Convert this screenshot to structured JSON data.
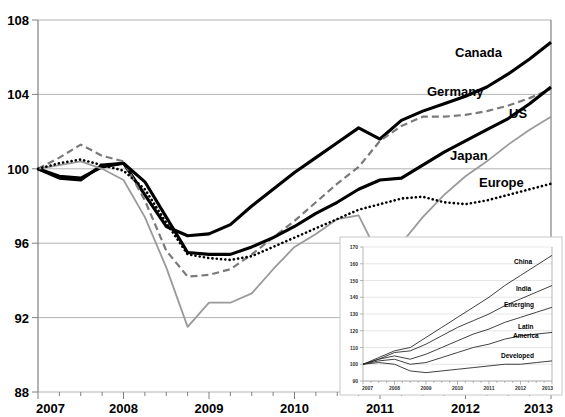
{
  "chart_data": [
    {
      "id": "main",
      "type": "line",
      "title": "",
      "subtitle": "",
      "xlabel": "",
      "ylabel": "",
      "xlim": [
        2007,
        2013
      ],
      "ylim": [
        88,
        108
      ],
      "yticks": [
        88,
        92,
        96,
        100,
        104,
        108
      ],
      "xticks": [
        2007,
        2008,
        2009,
        2010,
        2011,
        2012,
        2013
      ],
      "xtick_labels": [
        "2007",
        "2008",
        "2009",
        "2010",
        "2011",
        "2012",
        "2013"
      ],
      "ytick_labels": [
        "88",
        "92",
        "96",
        "100",
        "104",
        "108"
      ],
      "grid": true,
      "legend_position": "inline-right",
      "x": [
        2007.0,
        2007.25,
        2007.5,
        2007.75,
        2008.0,
        2008.25,
        2008.5,
        2008.75,
        2009.0,
        2009.25,
        2009.5,
        2009.75,
        2010.0,
        2010.25,
        2010.5,
        2010.75,
        2011.0,
        2011.25,
        2011.5,
        2011.75,
        2012.0,
        2012.25,
        2012.5,
        2012.75,
        2013.0
      ],
      "series": [
        {
          "name": "Canada",
          "style": "solid-thick-black",
          "color": "#000000",
          "values": [
            100.0,
            99.5,
            99.4,
            100.2,
            100.3,
            98.6,
            96.9,
            96.4,
            96.5,
            97.0,
            98.0,
            98.9,
            99.8,
            100.6,
            101.4,
            102.2,
            101.6,
            102.6,
            103.1,
            103.5,
            103.9,
            104.4,
            105.1,
            105.9,
            106.8
          ]
        },
        {
          "name": "Germany",
          "style": "dashed-gray",
          "color": "#7a7a7a",
          "values": [
            100.0,
            100.6,
            101.3,
            100.7,
            100.4,
            98.3,
            95.6,
            94.2,
            94.3,
            94.6,
            95.4,
            96.3,
            97.2,
            98.2,
            99.2,
            100.1,
            101.5,
            102.3,
            102.8,
            102.8,
            102.9,
            103.1,
            103.4,
            103.8,
            104.3
          ]
        },
        {
          "name": "US",
          "style": "solid-thick-black",
          "color": "#000000",
          "values": [
            100.0,
            99.6,
            99.5,
            100.1,
            100.3,
            99.3,
            97.4,
            95.5,
            95.4,
            95.4,
            95.8,
            96.3,
            96.9,
            97.6,
            98.2,
            98.9,
            99.4,
            99.5,
            100.2,
            100.9,
            101.5,
            102.1,
            102.7,
            103.5,
            104.4
          ]
        },
        {
          "name": "Japan",
          "style": "solid-thin-gray",
          "color": "#9a9a9a",
          "values": [
            100.0,
            100.2,
            100.4,
            100.0,
            99.4,
            97.4,
            94.7,
            91.5,
            92.8,
            92.8,
            93.3,
            94.6,
            95.8,
            96.5,
            97.3,
            97.5,
            95.2,
            96.0,
            97.4,
            98.6,
            99.6,
            100.4,
            101.3,
            102.1,
            102.8
          ]
        },
        {
          "name": "Europe",
          "style": "dotted-black",
          "color": "#000000",
          "values": [
            100.0,
            100.3,
            100.5,
            100.2,
            99.9,
            98.9,
            97.1,
            95.4,
            95.2,
            95.1,
            95.3,
            95.8,
            96.3,
            96.8,
            97.3,
            97.8,
            98.1,
            98.4,
            98.5,
            98.2,
            98.1,
            98.3,
            98.6,
            98.9,
            99.2
          ]
        }
      ]
    },
    {
      "id": "inset",
      "type": "line",
      "title": "",
      "xlabel": "",
      "ylabel": "",
      "xlim": [
        2007,
        2013
      ],
      "ylim": [
        90,
        170
      ],
      "yticks": [
        90,
        100,
        110,
        120,
        130,
        140,
        150,
        160,
        170
      ],
      "ytick_labels": [
        "90",
        "100",
        "110",
        "120",
        "130",
        "140",
        "150",
        "160",
        "170"
      ],
      "xticks": [
        2007,
        2008,
        2009,
        2010,
        2011,
        2012,
        2013
      ],
      "xtick_labels": [
        "2007",
        "2008",
        "2009",
        "2010",
        "2011",
        "2012",
        "2013"
      ],
      "grid": true,
      "x": [
        2007.0,
        2007.5,
        2008.0,
        2008.5,
        2009.0,
        2009.5,
        2010.0,
        2010.5,
        2011.0,
        2011.5,
        2012.0,
        2012.5,
        2013.0
      ],
      "series": [
        {
          "name": "China",
          "color": "#2b2b2b",
          "values": [
            100,
            104,
            108,
            110,
            116,
            122,
            128,
            134,
            140,
            147,
            153,
            159,
            165
          ]
        },
        {
          "name": "India",
          "color": "#2b2b2b",
          "values": [
            100,
            103,
            107,
            108,
            112,
            117,
            122,
            126,
            130,
            135,
            139,
            143,
            147
          ]
        },
        {
          "name": "Emerging",
          "color": "#2b2b2b",
          "values": [
            100,
            103,
            105,
            103,
            106,
            110,
            114,
            118,
            121,
            125,
            128,
            131,
            134
          ]
        },
        {
          "name": "Latin America",
          "color": "#2b2b2b",
          "values": [
            100,
            102,
            103,
            100,
            101,
            104,
            107,
            110,
            112,
            115,
            117,
            118,
            119
          ]
        },
        {
          "name": "Developed",
          "color": "#2b2b2b",
          "values": [
            100,
            101,
            100,
            96,
            95,
            96,
            97,
            98,
            99,
            100,
            100,
            101,
            102
          ]
        }
      ]
    }
  ],
  "main_chart": {
    "y_axis_labels": [
      "108",
      "104",
      "100",
      "96",
      "92",
      "88"
    ],
    "x_axis_labels": [
      "2007",
      "2008",
      "2009",
      "2010",
      "2011",
      "2012",
      "2013"
    ],
    "series_labels": [
      "Canada",
      "Germany",
      "US",
      "Japan",
      "Europe"
    ]
  },
  "inset_chart": {
    "y_axis_labels": [
      "170",
      "160",
      "150",
      "140",
      "130",
      "120",
      "110",
      "100",
      "90"
    ],
    "x_axis_labels": [
      "2007",
      "2008",
      "2009",
      "2010",
      "2011",
      "2012",
      "2013"
    ],
    "series_labels": [
      "China",
      "India",
      "Emerging",
      "Latin",
      "America",
      "Developed"
    ]
  },
  "colors": {
    "gridline": "#b3b3b3",
    "axis": "#808080",
    "canada": "#000000",
    "germany": "#7a7a7a",
    "us": "#000000",
    "japan": "#9a9a9a",
    "europe": "#000000",
    "background": "#ffffff"
  }
}
